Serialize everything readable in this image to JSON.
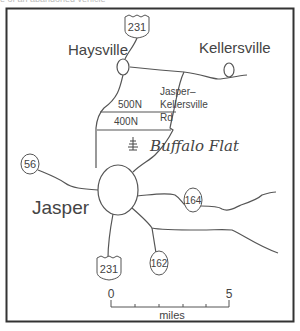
{
  "caption_fragment": "e of an abandoned vehicle",
  "map": {
    "towns": [
      {
        "name": "Haysville"
      },
      {
        "name": "Kellersville"
      },
      {
        "name": "Jasper"
      }
    ],
    "place": {
      "name": "Buffalo Flat"
    },
    "roads": {
      "r500n": "500N",
      "r400n": "400N",
      "jk_line1": "Jasper–",
      "jk_line2": "Kellersville",
      "jk_line3": "Rd"
    },
    "shields": {
      "us231_north": "231",
      "us231_south": "231",
      "sr56": "56",
      "sr164": "164",
      "sr162": "162"
    },
    "scale": {
      "min_label": "0",
      "max_label": "5",
      "unit": "miles"
    },
    "colors": {
      "ink": "#444444",
      "frame": "#333333"
    }
  }
}
